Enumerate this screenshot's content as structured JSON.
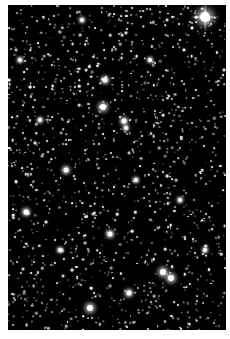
{
  "image": {
    "description": "Astronomical star field",
    "background": "#000000",
    "border_color": "#ffffff",
    "field": {
      "x": 8,
      "y": 5,
      "width": 218,
      "height": 325
    }
  },
  "bright_stars": [
    {
      "x": 205,
      "y": 17,
      "r": 5,
      "spikes": true
    },
    {
      "x": 105,
      "y": 80,
      "r": 2.5
    },
    {
      "x": 103,
      "y": 107,
      "r": 3
    },
    {
      "x": 124,
      "y": 121,
      "r": 2.5
    },
    {
      "x": 126,
      "y": 128,
      "r": 2
    },
    {
      "x": 66,
      "y": 170,
      "r": 2.5
    },
    {
      "x": 26,
      "y": 212,
      "r": 2.5
    },
    {
      "x": 110,
      "y": 234,
      "r": 2.5
    },
    {
      "x": 136,
      "y": 180,
      "r": 2
    },
    {
      "x": 163,
      "y": 272,
      "r": 3
    },
    {
      "x": 171,
      "y": 278,
      "r": 3
    },
    {
      "x": 129,
      "y": 293,
      "r": 2.5
    },
    {
      "x": 90,
      "y": 308,
      "r": 3
    },
    {
      "x": 205,
      "y": 250,
      "r": 2
    },
    {
      "x": 82,
      "y": 20,
      "r": 2
    },
    {
      "x": 40,
      "y": 120,
      "r": 2
    },
    {
      "x": 180,
      "y": 200,
      "r": 2
    },
    {
      "x": 60,
      "y": 250,
      "r": 2
    },
    {
      "x": 150,
      "y": 60,
      "r": 2
    },
    {
      "x": 20,
      "y": 60,
      "r": 2
    }
  ],
  "faint_star_count": 1400,
  "seed": 12345
}
